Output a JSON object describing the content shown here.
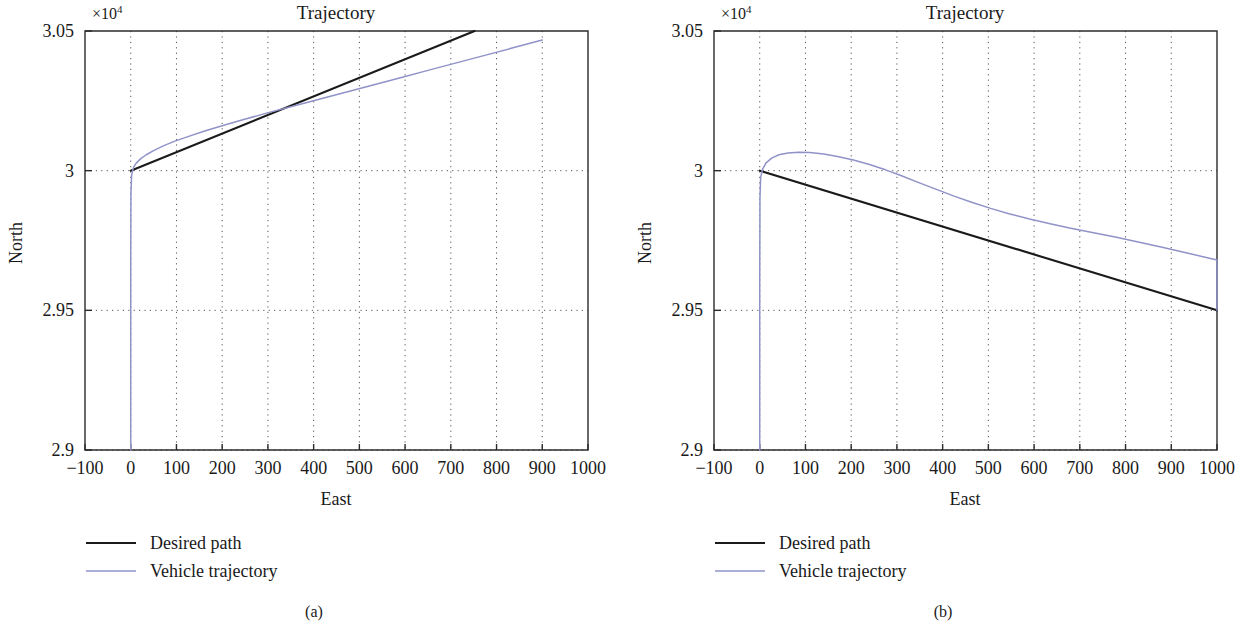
{
  "figure": {
    "panels": [
      {
        "caption": "(a)",
        "chart_data": {
          "type": "line",
          "title": "Trajectory",
          "xlabel": "East",
          "ylabel": "North",
          "y_exponent_label": "×10",
          "y_exponent_sup": "4",
          "y_scale": 10000,
          "xlim": [
            -100,
            1000
          ],
          "ylim": [
            2.9,
            3.05
          ],
          "xticks": [
            -100,
            0,
            100,
            200,
            300,
            400,
            500,
            600,
            700,
            800,
            900,
            1000
          ],
          "xticklabels": [
            "−100",
            "0",
            "100",
            "200",
            "300",
            "400",
            "500",
            "600",
            "700",
            "800",
            "900",
            "1000"
          ],
          "yticks": [
            2.9,
            2.95,
            3,
            3.05
          ],
          "yticklabels": [
            "2.9",
            "2.95",
            "3",
            "3.05"
          ],
          "grid": "dotted",
          "legend_position": "below-left",
          "series": [
            {
              "name": "Desired path",
              "color": "#1a1a1a",
              "points": [
                [
                  0,
                  3.0
                ],
                [
                  752,
                  3.05
                ]
              ]
            },
            {
              "name": "Vehicle trajectory",
              "color": "#8f93c8",
              "points": [
                [
                  0,
                  2.9
                ],
                [
                  0,
                  2.94
                ],
                [
                  0,
                  2.97
                ],
                [
                  0.5,
                  2.992
                ],
                [
                  2,
                  2.9985
                ],
                [
                  6,
                  3.0012
                ],
                [
                  12,
                  3.0027
                ],
                [
                  22,
                  3.0043
                ],
                [
                  34,
                  3.0057
                ],
                [
                  50,
                  3.0072
                ],
                [
                  70,
                  3.0088
                ],
                [
                  95,
                  3.0105
                ],
                [
                  125,
                  3.0122
                ],
                [
                  160,
                  3.0141
                ],
                [
                  200,
                  3.0161
                ],
                [
                  245,
                  3.0182
                ],
                [
                  295,
                  3.0205
                ],
                [
                  350,
                  3.0229
                ],
                [
                  410,
                  3.0255
                ],
                [
                  470,
                  3.0281
                ],
                [
                  530,
                  3.0307
                ],
                [
                  590,
                  3.0333
                ],
                [
                  650,
                  3.0359
                ],
                [
                  710,
                  3.0385
                ],
                [
                  770,
                  3.0411
                ],
                [
                  830,
                  3.0437
                ],
                [
                  875,
                  3.0457
                ],
                [
                  900,
                  3.0468
                ]
              ]
            }
          ]
        }
      },
      {
        "caption": "(b)",
        "chart_data": {
          "type": "line",
          "title": "Trajectory",
          "xlabel": "East",
          "ylabel": "North",
          "y_exponent_label": "×10",
          "y_exponent_sup": "4",
          "y_scale": 10000,
          "xlim": [
            -100,
            1000
          ],
          "ylim": [
            2.9,
            3.05
          ],
          "xticks": [
            -100,
            0,
            100,
            200,
            300,
            400,
            500,
            600,
            700,
            800,
            900,
            1000
          ],
          "xticklabels": [
            "−100",
            "0",
            "100",
            "200",
            "300",
            "400",
            "500",
            "600",
            "700",
            "800",
            "900",
            "1000"
          ],
          "yticks": [
            2.9,
            2.95,
            3,
            3.05
          ],
          "yticklabels": [
            "2.9",
            "2.95",
            "3",
            "3.05"
          ],
          "grid": "dotted",
          "legend_position": "below-left",
          "series": [
            {
              "name": "Desired path",
              "color": "#1a1a1a",
              "points": [
                [
                  0,
                  3.0
                ],
                [
                  1000,
                  2.95
                ]
              ]
            },
            {
              "name": "Vehicle trajectory",
              "color": "#8f93c8",
              "points": [
                [
                  0,
                  2.9
                ],
                [
                  0,
                  2.93
                ],
                [
                  0,
                  2.96
                ],
                [
                  0.5,
                  2.99
                ],
                [
                  2,
                  2.9975
                ],
                [
                  6,
                  3.0005
                ],
                [
                  14,
                  3.0028
                ],
                [
                  26,
                  3.0045
                ],
                [
                  42,
                  3.0057
                ],
                [
                  62,
                  3.0063
                ],
                [
                  85,
                  3.0066
                ],
                [
                  110,
                  3.0065
                ],
                [
                  140,
                  3.006
                ],
                [
                  170,
                  3.0051
                ],
                [
                  205,
                  3.0038
                ],
                [
                  240,
                  3.0022
                ],
                [
                  275,
                  3.0003
                ],
                [
                  310,
                  2.9982
                ],
                [
                  345,
                  2.9959
                ],
                [
                  385,
                  2.9934
                ],
                [
                  425,
                  2.9909
                ],
                [
                  465,
                  2.9886
                ],
                [
                  505,
                  2.9865
                ],
                [
                  545,
                  2.9846
                ],
                [
                  590,
                  2.9827
                ],
                [
                  635,
                  2.981
                ],
                [
                  680,
                  2.9794
                ],
                [
                  730,
                  2.9778
                ],
                [
                  780,
                  2.9762
                ],
                [
                  830,
                  2.9744
                ],
                [
                  880,
                  2.9726
                ],
                [
                  930,
                  2.9707
                ],
                [
                  1000,
                  2.968
                ],
                [
                  1000,
                  2.95
                ]
              ]
            }
          ]
        }
      }
    ],
    "legend": {
      "items": [
        {
          "label": "Desired path",
          "color": "#1a1a1a"
        },
        {
          "label": "Vehicle trajectory",
          "color": "#8f93c8"
        }
      ]
    }
  }
}
